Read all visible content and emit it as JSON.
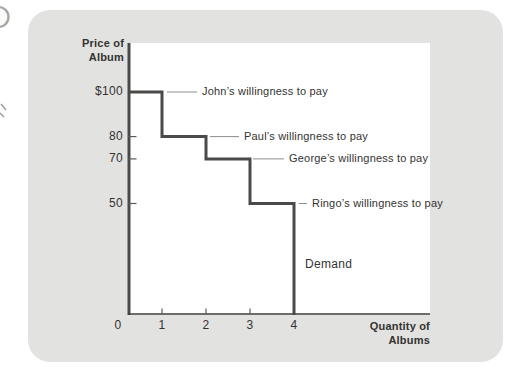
{
  "figure": {
    "panel_color": "#e2e2e0",
    "plot_color": "#ffffff",
    "curve_color": "#4a4a48",
    "axis_color": "#3c3c3a",
    "tick_color": "#5a5a58",
    "callout_color": "#8c8c8a",
    "text_color": "#333331",
    "artifact_color": "#a8a8a6"
  },
  "chart_data": {
    "type": "step-line",
    "title": "",
    "ylabel": "Price of Album",
    "ylabel_lines": [
      "Price of",
      "Album"
    ],
    "xlabel": "Quantity of Albums",
    "xlabel_lines": [
      "Quantity of",
      "Albums"
    ],
    "x_ticks": [
      "0",
      "1",
      "2",
      "3",
      "4"
    ],
    "y_ticks": [
      {
        "label": "$100",
        "value": 100
      },
      {
        "label": "80",
        "value": 80
      },
      {
        "label": "70",
        "value": 70
      },
      {
        "label": "50",
        "value": 50
      }
    ],
    "xlim": [
      0,
      7
    ],
    "ylim": [
      0,
      122
    ],
    "grid": false,
    "demand_schedule": {
      "x": [
        0,
        1,
        1,
        2,
        2,
        3,
        3,
        4,
        4
      ],
      "price": [
        100,
        100,
        80,
        80,
        70,
        70,
        50,
        50,
        0
      ]
    },
    "annotations": [
      {
        "buyer": "John",
        "price": 100,
        "label": "John’s willingness to pay"
      },
      {
        "buyer": "Paul",
        "price": 80,
        "label": "Paul’s willingness to pay"
      },
      {
        "buyer": "George",
        "price": 70,
        "label": "George’s willingness to pay"
      },
      {
        "buyer": "Ringo",
        "price": 50,
        "label": "Ringo’s willingness to pay"
      }
    ],
    "demand_label": "Demand"
  }
}
